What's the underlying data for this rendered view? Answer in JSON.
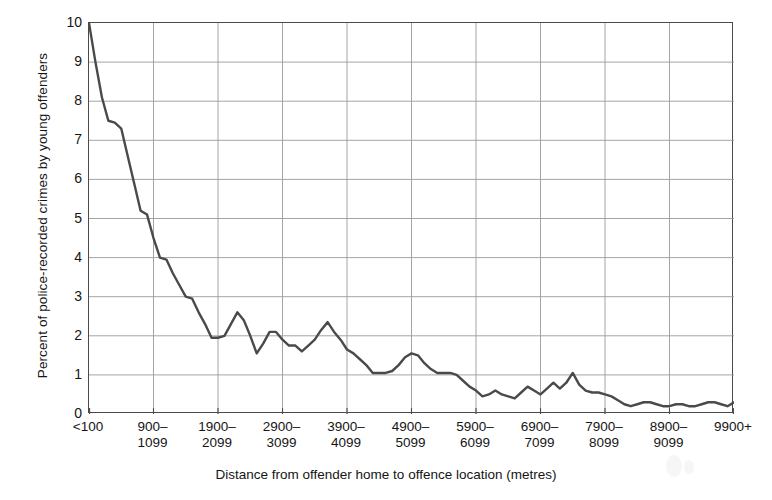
{
  "chart_data": {
    "type": "line",
    "title": "",
    "xlabel": "Distance from offender home to offence location (metres)",
    "ylabel": "Percent of police-recorded crimes by young offenders",
    "ylim": [
      0,
      10
    ],
    "yticks": [
      0,
      1,
      2,
      3,
      4,
      5,
      6,
      7,
      8,
      9,
      10
    ],
    "grid": true,
    "legend": "none",
    "xtick_labels": [
      "<100",
      "900–\n1099",
      "1900–\n2099",
      "2900–\n3099",
      "3900–\n4099",
      "4900–\n5099",
      "5900–\n6099",
      "6900–\n7099",
      "7900–\n8099",
      "8900–\n9099",
      "9900+"
    ],
    "xtick_positions_m": [
      0,
      1000,
      2000,
      3000,
      4000,
      5000,
      6000,
      7000,
      8000,
      9000,
      10000
    ],
    "x_units": "metres",
    "bin_width_m": 100,
    "x": [
      0,
      100,
      200,
      300,
      400,
      500,
      600,
      700,
      800,
      900,
      1000,
      1100,
      1200,
      1300,
      1400,
      1500,
      1600,
      1700,
      1800,
      1900,
      2000,
      2100,
      2200,
      2300,
      2400,
      2500,
      2600,
      2700,
      2800,
      2900,
      3000,
      3100,
      3200,
      3300,
      3400,
      3500,
      3600,
      3700,
      3800,
      3900,
      4000,
      4100,
      4200,
      4300,
      4400,
      4500,
      4600,
      4700,
      4800,
      4900,
      5000,
      5100,
      5200,
      5300,
      5400,
      5500,
      5600,
      5700,
      5800,
      5900,
      6000,
      6100,
      6200,
      6300,
      6400,
      6500,
      6600,
      6700,
      6800,
      6900,
      7000,
      7100,
      7200,
      7300,
      7400,
      7500,
      7600,
      7700,
      7800,
      7900,
      8000,
      8100,
      8200,
      8300,
      8400,
      8500,
      8600,
      8700,
      8800,
      8900,
      9000,
      9100,
      9200,
      9300,
      9400,
      9500,
      9600,
      9700,
      9800,
      9900,
      10000
    ],
    "values": [
      10.0,
      9.0,
      8.1,
      7.5,
      7.45,
      7.3,
      6.6,
      5.9,
      5.2,
      5.1,
      4.5,
      4.0,
      3.95,
      3.6,
      3.3,
      3.0,
      2.95,
      2.6,
      2.3,
      1.95,
      1.95,
      2.0,
      2.3,
      2.6,
      2.4,
      2.0,
      1.55,
      1.8,
      2.1,
      2.1,
      1.9,
      1.75,
      1.75,
      1.6,
      1.75,
      1.9,
      2.15,
      2.35,
      2.1,
      1.9,
      1.65,
      1.55,
      1.4,
      1.25,
      1.05,
      1.05,
      1.05,
      1.1,
      1.25,
      1.45,
      1.55,
      1.5,
      1.3,
      1.15,
      1.05,
      1.05,
      1.05,
      1.0,
      0.85,
      0.7,
      0.6,
      0.45,
      0.5,
      0.6,
      0.5,
      0.45,
      0.4,
      0.55,
      0.7,
      0.6,
      0.5,
      0.65,
      0.8,
      0.65,
      0.8,
      1.05,
      0.75,
      0.6,
      0.55,
      0.55,
      0.5,
      0.45,
      0.35,
      0.25,
      0.2,
      0.25,
      0.3,
      0.3,
      0.25,
      0.2,
      0.2,
      0.25,
      0.25,
      0.2,
      0.2,
      0.25,
      0.3,
      0.3,
      0.25,
      0.2,
      0.3
    ],
    "colors": {
      "line": "#4a4a4a",
      "grid": "#9a9a9a",
      "axis": "#4a4a4a",
      "background": "#ffffff",
      "text": "#151515"
    },
    "line_width_px": 2.4
  }
}
